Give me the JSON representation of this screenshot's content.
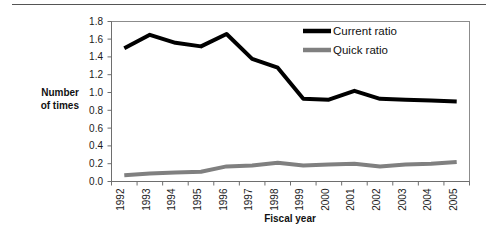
{
  "chart_data": {
    "type": "line",
    "title": "",
    "xlabel": "Fiscal year",
    "ylabel": "Number of times",
    "ylabel_line1": "Number",
    "ylabel_line2": "of times",
    "categories": [
      "1992",
      "1993",
      "1994",
      "1995",
      "1996",
      "1997",
      "1998",
      "1999",
      "2000",
      "2001",
      "2002",
      "2003",
      "2004",
      "2005"
    ],
    "series": [
      {
        "name": "Current ratio",
        "color": "#000000",
        "values": [
          1.5,
          1.65,
          1.56,
          1.52,
          1.66,
          1.38,
          1.28,
          0.93,
          0.92,
          1.02,
          0.93,
          0.92,
          0.91,
          0.9
        ]
      },
      {
        "name": "Quick ratio",
        "color": "#808080",
        "values": [
          0.07,
          0.09,
          0.1,
          0.11,
          0.17,
          0.18,
          0.21,
          0.18,
          0.19,
          0.2,
          0.17,
          0.19,
          0.2,
          0.22
        ]
      }
    ],
    "ylim": [
      0.0,
      1.8
    ],
    "ytick_values": [
      "0.0",
      "0.2",
      "0.4",
      "0.6",
      "0.8",
      "1.0",
      "1.2",
      "1.4",
      "1.6",
      "1.8"
    ],
    "grid": false,
    "legend_position": "top-right",
    "legend": [
      {
        "label": "Current ratio",
        "color": "#000000"
      },
      {
        "label": "Quick ratio",
        "color": "#808080"
      }
    ]
  }
}
